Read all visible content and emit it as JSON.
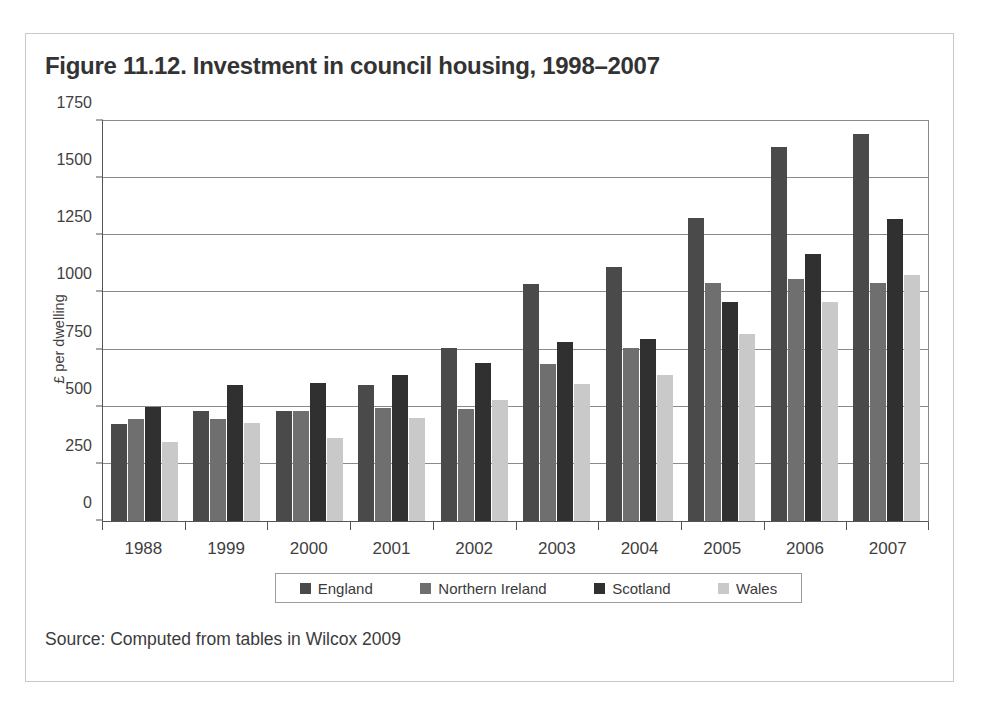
{
  "figure": {
    "title": "Figure 11.12. Investment in council housing, 1998–2007",
    "source": "Source: Computed from tables in Wilcox 2009"
  },
  "legend": {
    "items": [
      {
        "label": "England",
        "color": "#4a4a4a",
        "swatch_name": "legend-swatch-england"
      },
      {
        "label": "Northern Ireland",
        "color": "#6f6f6f",
        "swatch_name": "legend-swatch-northern-ireland"
      },
      {
        "label": "Scotland",
        "color": "#303030",
        "swatch_name": "legend-swatch-scotland"
      },
      {
        "label": "Wales",
        "color": "#c9c9c9",
        "swatch_name": "legend-swatch-wales"
      }
    ]
  },
  "chart_data": {
    "type": "bar",
    "title": "Figure 11.12. Investment in council housing, 1998–2007",
    "xlabel": "",
    "ylabel": "£ per dwelling",
    "ylim": [
      0,
      1750
    ],
    "yticks": [
      0,
      250,
      500,
      750,
      1000,
      1250,
      1500,
      1750
    ],
    "ytick_labels": [
      "0",
      "250",
      "500",
      "750",
      "1000",
      "1250",
      "1500",
      "1750"
    ],
    "categories": [
      "1988",
      "1999",
      "2000",
      "2001",
      "2002",
      "2003",
      "2004",
      "2005",
      "2006",
      "2007"
    ],
    "grid": true,
    "legend_position": "bottom",
    "series": [
      {
        "name": "England",
        "color": "#4a4a4a",
        "values": [
          425,
          480,
          480,
          595,
          755,
          1035,
          1110,
          1325,
          1635,
          1695
        ]
      },
      {
        "name": "Northern Ireland",
        "color": "#6f6f6f",
        "values": [
          445,
          445,
          480,
          495,
          490,
          685,
          755,
          1040,
          1060,
          1040
        ]
      },
      {
        "name": "Scotland",
        "color": "#303030",
        "values": [
          500,
          595,
          605,
          640,
          690,
          785,
          795,
          960,
          1170,
          1320
        ]
      },
      {
        "name": "Wales",
        "color": "#c9c9c9",
        "values": [
          345,
          430,
          365,
          450,
          530,
          600,
          640,
          820,
          960,
          1075
        ]
      }
    ]
  }
}
